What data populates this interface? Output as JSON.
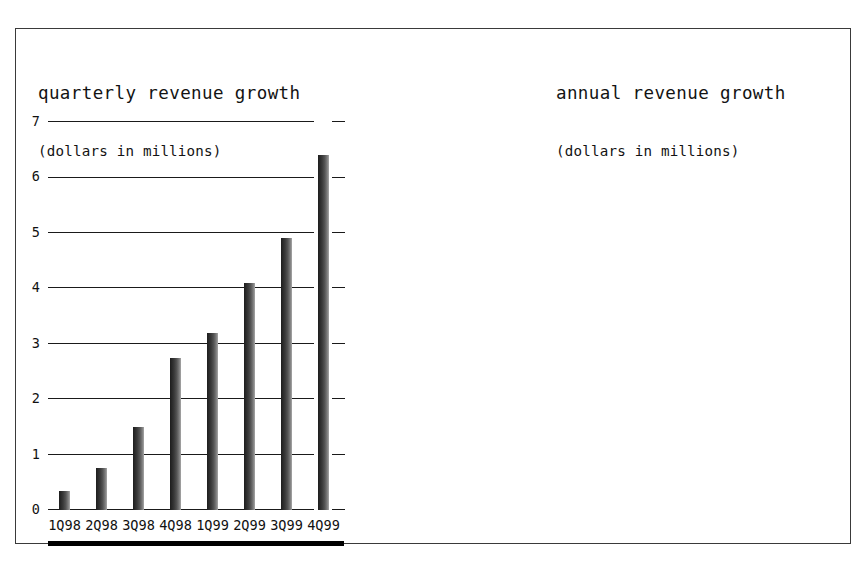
{
  "figure": {
    "background_color": "#ffffff",
    "frame_color": "#3a3a3a",
    "bar_color": "#2a2a2a",
    "axis_color": "#1a1a1a"
  },
  "chart_data": [
    {
      "id": "quarterly",
      "type": "bar",
      "title": "quarterly revenue growth",
      "subtitle": "(dollars in millions)",
      "xlabel": "",
      "ylabel": "",
      "ylim": [
        0,
        7
      ],
      "grid": true,
      "legend": "none",
      "categories": [
        "1Q98",
        "2Q98",
        "3Q98",
        "4Q98",
        "1Q99",
        "2Q99",
        "3Q99",
        "4Q99"
      ],
      "values": [
        0.35,
        0.75,
        1.5,
        2.75,
        3.2,
        4.1,
        4.9,
        6.4
      ],
      "yticks": [
        0,
        1,
        2,
        3,
        4,
        5,
        6,
        7
      ],
      "ytick_labels": [
        "0",
        "1",
        "2",
        "3",
        "4",
        "5",
        "6",
        "7"
      ]
    },
    {
      "id": "annual",
      "type": "bar",
      "title": "annual revenue growth",
      "subtitle": "(dollars in millions)",
      "xlabel": "",
      "ylabel": "",
      "ylim": [
        0,
        20
      ],
      "grid": true,
      "legend": "none",
      "categories": [
        "1997",
        "1998",
        "1999"
      ],
      "values": [
        0.7,
        5.4,
        18.8
      ],
      "yticks": [
        0,
        2.5,
        5.0,
        7.5,
        10.0,
        12.5,
        15.0,
        17.5,
        20.0
      ],
      "ytick_labels": [
        "0",
        "2.5",
        "5.0",
        "7.5",
        "10.0",
        "12.5",
        "15.0",
        "17.5",
        "20.0"
      ]
    }
  ]
}
